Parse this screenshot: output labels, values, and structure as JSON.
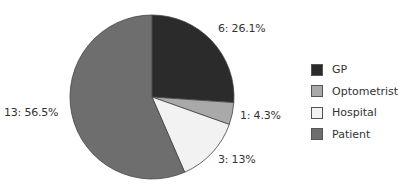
{
  "chart_data": {
    "type": "pie",
    "title": "",
    "categories": [
      "GP",
      "Optometrist",
      "Hospital",
      "Patient"
    ],
    "values": [
      6,
      1,
      3,
      13
    ],
    "percentages": [
      26.1,
      4.3,
      13,
      56.5
    ],
    "labels": [
      "6: 26.1%",
      "1: 4.3%",
      "3: 13%",
      "13: 56.5%"
    ],
    "colors": [
      "#2b2b2b",
      "#a9a9a9",
      "#f2f2f2",
      "#6e6e6e"
    ],
    "legend_position": "right",
    "start_angle": "12 o'clock, clockwise"
  },
  "legend": {
    "items": [
      {
        "label": "GP",
        "color": "#2b2b2b"
      },
      {
        "label": "Optometrist",
        "color": "#a9a9a9"
      },
      {
        "label": "Hospital",
        "color": "#f2f2f2"
      },
      {
        "label": "Patient",
        "color": "#6e6e6e"
      }
    ]
  }
}
